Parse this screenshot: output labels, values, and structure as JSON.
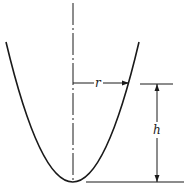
{
  "diagram": {
    "colors": {
      "background": "#ffffff",
      "stroke": "#1a1a1a"
    },
    "labels": {
      "radius": "r",
      "height": "h"
    },
    "geometry": {
      "vertex": [
        73,
        182
      ],
      "left_top": [
        6,
        42
      ],
      "right_top": [
        139,
        42
      ],
      "axis_x": 73,
      "axis_y_range": [
        3,
        182
      ],
      "radius_line_y": 83,
      "radius_arrow_tip_x": 129,
      "height_line_x": 157,
      "height_top_y": 84,
      "height_bottom_y": 182,
      "baseline": {
        "x1": 86,
        "x2": 184,
        "y": 182
      },
      "top_ref_line": {
        "x1": 140,
        "x2": 173,
        "y": 84
      }
    }
  }
}
